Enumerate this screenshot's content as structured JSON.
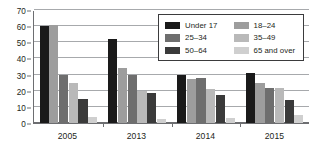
{
  "chart_data": {
    "type": "bar",
    "title": "",
    "xlabel": "",
    "ylabel": "",
    "categories": [
      "2005",
      "2013",
      "2014",
      "2015"
    ],
    "ylim": [
      0,
      70
    ],
    "yticks": [
      0,
      10,
      20,
      30,
      40,
      50,
      60,
      70
    ],
    "grid": true,
    "legend_position": "top-right",
    "series": [
      {
        "name": "Under 17",
        "color": "#1a1a1a",
        "values": [
          60.0,
          52.0,
          30.0,
          31.0
        ]
      },
      {
        "name": "18–24",
        "color": "#9d9d9d",
        "values": [
          61.0,
          34.0,
          27.0,
          25.0
        ]
      },
      {
        "name": "25–34",
        "color": "#6e6e6e",
        "values": [
          30.0,
          30.0,
          28.0,
          21.5
        ]
      },
      {
        "name": "35–49",
        "color": "#b9b9b9",
        "values": [
          24.5,
          20.0,
          21.0,
          22.0
        ]
      },
      {
        "name": "50–64",
        "color": "#3a3a3a",
        "values": [
          15.0,
          18.5,
          17.5,
          14.0
        ]
      },
      {
        "name": "65 and over",
        "color": "#cfcfcf",
        "values": [
          3.5,
          2.5,
          3.0,
          5.0
        ]
      }
    ]
  },
  "legend": {
    "items": [
      {
        "label": "Under 17",
        "color": "#1a1a1a"
      },
      {
        "label": "18–24",
        "color": "#9d9d9d"
      },
      {
        "label": "25–34",
        "color": "#6e6e6e"
      },
      {
        "label": "35–49",
        "color": "#b9b9b9"
      },
      {
        "label": "50–64",
        "color": "#3a3a3a"
      },
      {
        "label": "65 and over",
        "color": "#cfcfcf"
      }
    ]
  },
  "axis": {
    "y_tick_labels": [
      "70",
      "60",
      "50",
      "40",
      "30",
      "20",
      "10",
      "0"
    ],
    "x_tick_labels": [
      "2005",
      "2013",
      "2014",
      "2015"
    ]
  },
  "style": {
    "axis_color": "#6d6e71",
    "grid_color": "#a7a9ac",
    "text_color": "#231f20",
    "background": "#ffffff"
  }
}
